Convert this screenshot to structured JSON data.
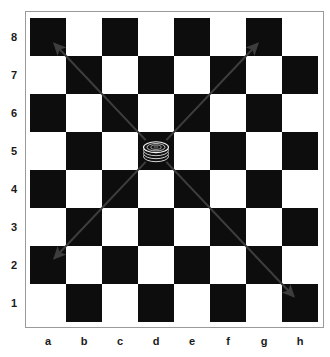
{
  "board": {
    "type": "checkers-board",
    "files": [
      "a",
      "b",
      "c",
      "d",
      "e",
      "f",
      "g",
      "h"
    ],
    "ranks": [
      "8",
      "7",
      "6",
      "5",
      "4",
      "3",
      "2",
      "1"
    ],
    "size": 8,
    "light_square_color": "#ffffff",
    "dark_square_color": "#0d0d0d",
    "frame_color": "#9a9a9a",
    "a8_square_color": "dark",
    "a1_square_color": "light"
  },
  "piece": {
    "name": "checker-king",
    "label": "",
    "color": "black",
    "square": "d5",
    "file_index": 3,
    "rank_index": 3,
    "is_king": true,
    "stack_layers": 3
  },
  "arrows": {
    "color": "#3d3d3d",
    "origin_square": "d5",
    "items": [
      {
        "name": "arrow-up-left",
        "from": "d5",
        "to": "a8",
        "direction": "up-left"
      },
      {
        "name": "arrow-up-right",
        "from": "d5",
        "to": "g8",
        "direction": "up-right"
      },
      {
        "name": "arrow-down-left",
        "from": "d5",
        "to": "a2",
        "direction": "down-left"
      },
      {
        "name": "arrow-down-right",
        "from": "d5",
        "to": "h1",
        "direction": "down-right"
      }
    ]
  },
  "chart_data": {
    "type": "heatmap",
    "title": "",
    "xlabel": "",
    "ylabel": "",
    "categories": [
      "a",
      "b",
      "c",
      "d",
      "e",
      "f",
      "g",
      "h"
    ],
    "rows": [
      "8",
      "7",
      "6",
      "5",
      "4",
      "3",
      "2",
      "1"
    ],
    "legend": [],
    "grid": true,
    "values": [
      [
        1,
        0,
        1,
        0,
        1,
        0,
        1,
        0
      ],
      [
        0,
        1,
        0,
        1,
        0,
        1,
        0,
        1
      ],
      [
        1,
        0,
        1,
        0,
        1,
        0,
        1,
        0
      ],
      [
        0,
        1,
        0,
        1,
        0,
        1,
        0,
        1
      ],
      [
        1,
        0,
        1,
        0,
        1,
        0,
        1,
        0
      ],
      [
        0,
        1,
        0,
        1,
        0,
        1,
        0,
        1
      ],
      [
        1,
        0,
        1,
        0,
        1,
        0,
        1,
        0
      ],
      [
        0,
        1,
        0,
        1,
        0,
        1,
        0,
        1
      ]
    ],
    "annotations": [
      {
        "square": "d5",
        "marker": "checker-king"
      },
      {
        "square": "a8",
        "marker": "arrow-head"
      },
      {
        "square": "g8",
        "marker": "arrow-head"
      },
      {
        "square": "a2",
        "marker": "arrow-head"
      },
      {
        "square": "h1",
        "marker": "arrow-head"
      }
    ]
  }
}
